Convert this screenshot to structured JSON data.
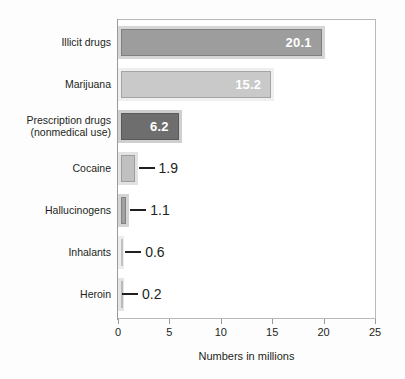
{
  "chart_data": {
    "type": "bar",
    "orientation": "horizontal",
    "title": "",
    "xlabel": "Numbers in millions",
    "ylabel": "",
    "xlim": [
      0,
      25
    ],
    "xticks": [
      0,
      5,
      10,
      15,
      20,
      25
    ],
    "xtick_labels": [
      "0",
      "5",
      "10",
      "15",
      "20",
      "25"
    ],
    "grid": false,
    "legend": false,
    "categories": [
      "Illicit drugs",
      "Marijuana",
      "Prescription drugs\n(nonmedical use)",
      "Cocaine",
      "Hallucinogens",
      "Inhalants",
      "Heroin"
    ],
    "values": [
      20.1,
      15.2,
      6.2,
      1.9,
      1.1,
      0.6,
      0.2
    ],
    "value_labels": [
      "20.1",
      "15.2",
      "6.2",
      "1.9",
      "1.1",
      "0.6",
      "0.2"
    ],
    "label_placement": [
      "inside",
      "inside",
      "inside",
      "outside",
      "outside",
      "outside",
      "outside"
    ],
    "bar_colors": [
      "#9d9d9d",
      "#c9c9c9",
      "#6e6e6e",
      "#c0c0c0",
      "#a0a0a0",
      "#d8d8d8",
      "#bdbdbd"
    ],
    "bar_edge_colors": [
      "#d6d6d6",
      "#eeeeee",
      "#cfcfcf",
      "#e2e2e2",
      "#d4d4d4",
      "#ededed",
      "#e4e4e4"
    ],
    "inside_label_color": "#ffffff",
    "outside_label_color": "#231f20",
    "axis_color": "#9a9a9a",
    "background_color": "#ffffff"
  },
  "bars": [
    {
      "category": "Illicit drugs",
      "label": "Illicit drugs",
      "value": "20.1",
      "value_num": 20.1,
      "fill": "#9d9d9d",
      "edge": "#d6d6d6",
      "inside": true
    },
    {
      "category": "Marijuana",
      "label": "Marijuana",
      "value": "15.2",
      "value_num": 15.2,
      "fill": "#c9c9c9",
      "edge": "#efefef",
      "inside": true
    },
    {
      "category": "Prescription drugs (nonmedical use)",
      "label": "Prescription drugs\n(nonmedical use)",
      "value": "6.2",
      "value_num": 6.2,
      "fill": "#6e6e6e",
      "edge": "#cfcfcf",
      "inside": true
    },
    {
      "category": "Cocaine",
      "label": "Cocaine",
      "value": "1.9",
      "value_num": 1.9,
      "fill": "#c0c0c0",
      "edge": "#e2e2e2",
      "inside": false
    },
    {
      "category": "Hallucinogens",
      "label": "Hallucinogens",
      "value": "1.1",
      "value_num": 1.1,
      "fill": "#a0a0a0",
      "edge": "#d4d4d4",
      "inside": false
    },
    {
      "category": "Inhalants",
      "label": "Inhalants",
      "value": "0.6",
      "value_num": 0.6,
      "fill": "#d8d8d8",
      "edge": "#ededed",
      "inside": false
    },
    {
      "category": "Heroin",
      "label": "Heroin",
      "value": "0.2",
      "value_num": 0.2,
      "fill": "#bdbdbd",
      "edge": "#e4e4e4",
      "inside": false
    }
  ],
  "axis": {
    "x_title": "Numbers in millions",
    "ticks": [
      "0",
      "5",
      "10",
      "15",
      "20",
      "25"
    ],
    "tick_values": [
      0,
      5,
      10,
      15,
      20,
      25
    ]
  }
}
